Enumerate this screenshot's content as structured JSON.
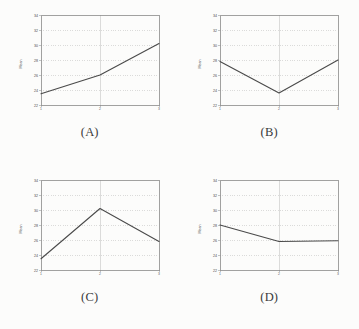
{
  "figure": {
    "background_color": "#fcfcfb",
    "line_color": "#4a4a4a",
    "axis_color": "#8a8a8a",
    "grid_color": "#b9b9b9",
    "panels": [
      {
        "id": "A",
        "caption": "(A)"
      },
      {
        "id": "B",
        "caption": "(B)"
      },
      {
        "id": "C",
        "caption": "(C)"
      },
      {
        "id": "D",
        "caption": "(D)"
      }
    ]
  },
  "chart_data": [
    {
      "type": "line",
      "panel": "A",
      "title": "(A)",
      "xlabel": "",
      "ylabel": "Mean",
      "x": [
        1,
        2,
        3
      ],
      "categories": [
        "1",
        "2",
        "3"
      ],
      "values": [
        23.5,
        26.0,
        30.2
      ],
      "series": [
        {
          "name": "series-a",
          "values": [
            23.5,
            26.0,
            30.2
          ]
        }
      ],
      "xlim": [
        1,
        3
      ],
      "ylim": [
        22,
        34
      ],
      "xticks": [
        "1",
        "2",
        "3"
      ],
      "yticks": [
        "22",
        "24",
        "26",
        "28",
        "30",
        "32",
        "34"
      ],
      "grid": true,
      "legend": "none"
    },
    {
      "type": "line",
      "panel": "B",
      "title": "(B)",
      "xlabel": "",
      "ylabel": "Mean",
      "x": [
        1,
        2,
        3
      ],
      "categories": [
        "1",
        "2",
        "3"
      ],
      "values": [
        27.8,
        23.6,
        28.0
      ],
      "series": [
        {
          "name": "series-b",
          "values": [
            27.8,
            23.6,
            28.0
          ]
        }
      ],
      "xlim": [
        1,
        3
      ],
      "ylim": [
        22,
        34
      ],
      "xticks": [
        "1",
        "2",
        "3"
      ],
      "yticks": [
        "22",
        "24",
        "26",
        "28",
        "30",
        "32",
        "34"
      ],
      "grid": true,
      "legend": "none"
    },
    {
      "type": "line",
      "panel": "C",
      "title": "(C)",
      "xlabel": "",
      "ylabel": "Mean",
      "x": [
        1,
        2,
        3
      ],
      "categories": [
        "1",
        "2",
        "3"
      ],
      "values": [
        23.5,
        30.2,
        25.8
      ],
      "series": [
        {
          "name": "series-c",
          "values": [
            23.5,
            30.2,
            25.8
          ]
        }
      ],
      "xlim": [
        1,
        3
      ],
      "ylim": [
        22,
        34
      ],
      "xticks": [
        "1",
        "2",
        "3"
      ],
      "yticks": [
        "22",
        "24",
        "26",
        "28",
        "30",
        "32",
        "34"
      ],
      "grid": true,
      "legend": "none"
    },
    {
      "type": "line",
      "panel": "D",
      "title": "(D)",
      "xlabel": "",
      "ylabel": "Mean",
      "x": [
        1,
        2,
        3
      ],
      "categories": [
        "1",
        "2",
        "3"
      ],
      "values": [
        28.0,
        25.8,
        25.9
      ],
      "series": [
        {
          "name": "series-d",
          "values": [
            28.0,
            25.8,
            25.9
          ]
        }
      ],
      "xlim": [
        1,
        3
      ],
      "ylim": [
        22,
        34
      ],
      "xticks": [
        "1",
        "2",
        "3"
      ],
      "yticks": [
        "22",
        "24",
        "26",
        "28",
        "30",
        "32",
        "34"
      ],
      "grid": true,
      "legend": "none"
    }
  ]
}
